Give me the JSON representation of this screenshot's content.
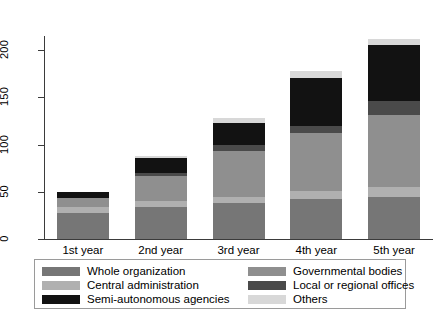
{
  "chart_data": {
    "type": "bar",
    "subtype": "stacked-bar",
    "title": "",
    "xlabel": "",
    "ylabel": "",
    "categories": [
      "1st year",
      "2nd year",
      "3rd year",
      "4th year",
      "5th year"
    ],
    "ylim": [
      0,
      215
    ],
    "yticks": [
      0,
      50,
      100,
      150,
      200
    ],
    "ytick_labels": [
      "0",
      "50",
      "100",
      "150",
      "200"
    ],
    "grid": false,
    "legend_position": "bottom",
    "series": [
      {
        "name": "Whole organization",
        "color": "#767676",
        "values": [
          28,
          34,
          38,
          42,
          45
        ]
      },
      {
        "name": "Central administration",
        "color": "#b0b0b0",
        "values": [
          6,
          6,
          7,
          9,
          10
        ]
      },
      {
        "name": "Governmental bodies",
        "color": "#8f8f8f",
        "values": [
          9,
          27,
          48,
          61,
          76
        ]
      },
      {
        "name": "Local or regional offices",
        "color": "#4a4a4a",
        "values": [
          0,
          3,
          7,
          8,
          15
        ]
      },
      {
        "name": "Semi-autonomous agencies",
        "color": "#121212",
        "values": [
          7,
          16,
          23,
          51,
          59
        ]
      },
      {
        "name": "Others",
        "color": "#d8d8d8",
        "values": [
          0,
          2,
          5,
          7,
          7
        ]
      }
    ],
    "totals": [
      50,
      88,
      128,
      178,
      212
    ]
  },
  "legend": {
    "columns": [
      {
        "entries": [
          {
            "label": "Whole organization",
            "color": "#767676"
          },
          {
            "label": "Central administration",
            "color": "#b0b0b0"
          },
          {
            "label": "Semi-autonomous agencies",
            "color": "#121212"
          }
        ]
      },
      {
        "entries": [
          {
            "label": "Governmental bodies",
            "color": "#8f8f8f"
          },
          {
            "label": "Local or regional offices",
            "color": "#4a4a4a"
          },
          {
            "label": "Others",
            "color": "#d8d8d8"
          }
        ]
      }
    ]
  }
}
